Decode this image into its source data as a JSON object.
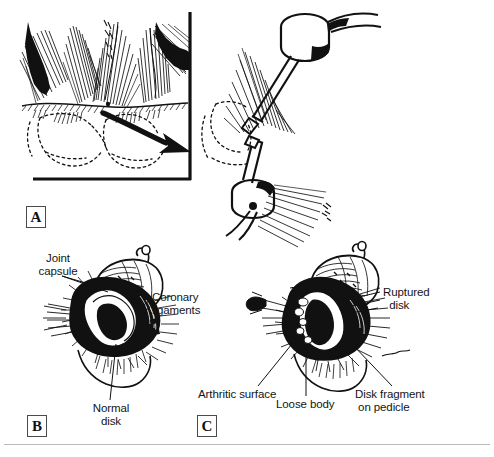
{
  "figure": {
    "background_color": "#ffffff",
    "ink_color": "#111111",
    "rule_color": "#b9b9b9",
    "width": 494,
    "height": 457
  },
  "panels": [
    {
      "letter": "A",
      "caption": "",
      "description": "Sagittal view of joint space with arthroscopic approach arrow and instrument cannulae"
    },
    {
      "letter": "B",
      "caption": "",
      "description": "Normal temporomandibular joint disk anatomy"
    },
    {
      "letter": "C",
      "caption": "",
      "description": "Pathologic temporomandibular joint with ruptured disk"
    }
  ],
  "annotations": {
    "joint_capsule": "Joint\ncapsule",
    "coronary_ligaments": "Coronary\nligaments",
    "normal_disk": "Normal\ndisk",
    "ruptured_disk": "Ruptured\n  disk",
    "arthritic_surface": "Arthritic surface",
    "loose_body": "Loose body",
    "disk_fragment": "Disk fragment\n on pedicle"
  }
}
